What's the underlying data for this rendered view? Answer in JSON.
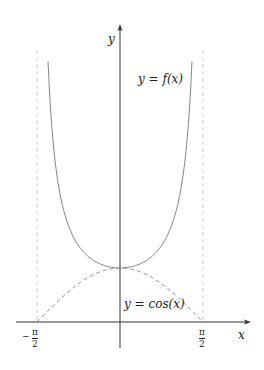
{
  "chart_data": {
    "type": "line",
    "title": "",
    "xlabel": "x",
    "ylabel": "y",
    "xlim": [
      -1.5708,
      1.5708
    ],
    "grid": false,
    "series": [
      {
        "name": "y = f(x)",
        "style": "solid",
        "color": "#777777",
        "function": "sec(x)",
        "x": [
          -1.36,
          -1.2,
          -1.0,
          -0.8,
          -0.6,
          -0.4,
          -0.2,
          0,
          0.2,
          0.4,
          0.6,
          0.8,
          1.0,
          1.2,
          1.36
        ],
        "y": [
          4.78,
          2.76,
          1.85,
          1.44,
          1.21,
          1.09,
          1.02,
          1.0,
          1.02,
          1.09,
          1.21,
          1.44,
          1.85,
          2.76,
          4.78
        ]
      },
      {
        "name": "y = cos(x)",
        "style": "dashed",
        "color": "#888888",
        "function": "cos(x)",
        "x": [
          -1.5708,
          -1.0,
          -0.5,
          0,
          0.5,
          1.0,
          1.5708
        ],
        "y": [
          0,
          0.54,
          0.878,
          1.0,
          0.878,
          0.54,
          0
        ]
      }
    ],
    "asymptotes": [
      {
        "x": -1.5708,
        "style": "dashed"
      },
      {
        "x": 1.5708,
        "style": "dashed"
      }
    ],
    "tick_labels": {
      "x": [
        "-π/2",
        "π/2"
      ]
    },
    "annotations": [
      "y = f(x)",
      "y = cos(x)"
    ]
  },
  "labels": {
    "x_axis": "x",
    "y_axis": "y",
    "f_curve": "y = f(x)",
    "cos_curve": "y = cos(x)",
    "tick_left_sign": "−",
    "tick_num": "π",
    "tick_den": "2"
  }
}
